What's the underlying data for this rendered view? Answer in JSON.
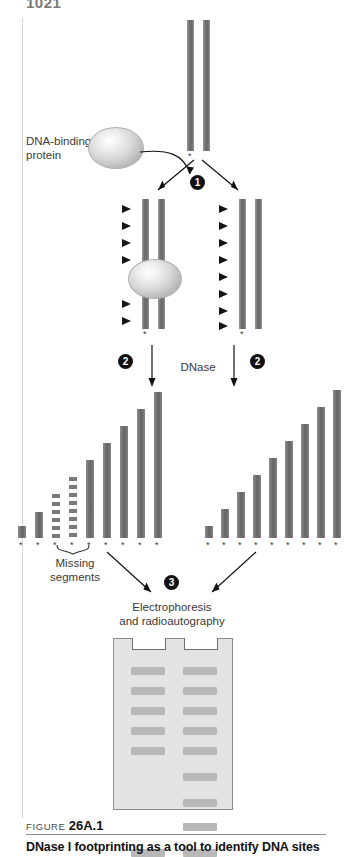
{
  "page": {
    "number": "1021"
  },
  "figure": {
    "labels": {
      "dna_binding_protein": "DNA-binding\nprotein",
      "dnase": "DNase",
      "missing_segments": "Missing\nsegments",
      "electrophoresis": "Electrophoresis\nand radioautography"
    },
    "steps": [
      {
        "id": "step-1",
        "number": "1"
      },
      {
        "id": "step-2-left",
        "number": "2"
      },
      {
        "id": "step-2-right",
        "number": "2"
      },
      {
        "id": "step-3",
        "number": "3"
      }
    ],
    "top_dna": {
      "name": "labeled-dna-duplex",
      "label_marker": "*",
      "strand_count": 2
    },
    "protein_bound_dna": {
      "name": "protein-bound-dna",
      "cut_sites_above": 4,
      "cut_sites_below": 2,
      "protected_region": true,
      "label_marker": "*"
    },
    "free_dna": {
      "name": "free-dna",
      "cut_sites": 8,
      "label_marker": "*"
    },
    "ladder_left": {
      "name": "fragment-ladder-protected",
      "marker": "*",
      "bars": [
        {
          "height": 12,
          "style": "solid"
        },
        {
          "height": 26,
          "style": "solid"
        },
        {
          "height": 44,
          "style": "dashed"
        },
        {
          "height": 61,
          "style": "dashed"
        },
        {
          "height": 78,
          "style": "solid"
        },
        {
          "height": 95,
          "style": "solid"
        },
        {
          "height": 112,
          "style": "solid"
        },
        {
          "height": 129,
          "style": "solid"
        },
        {
          "height": 146,
          "style": "solid"
        }
      ]
    },
    "ladder_right": {
      "name": "fragment-ladder-free",
      "marker": "*",
      "bars": [
        {
          "height": 12,
          "style": "solid"
        },
        {
          "height": 29,
          "style": "solid"
        },
        {
          "height": 46,
          "style": "solid"
        },
        {
          "height": 63,
          "style": "solid"
        },
        {
          "height": 80,
          "style": "solid"
        },
        {
          "height": 97,
          "style": "solid"
        },
        {
          "height": 114,
          "style": "solid"
        },
        {
          "height": 131,
          "style": "solid"
        },
        {
          "height": 148,
          "style": "solid"
        }
      ]
    },
    "gel": {
      "name": "autoradiogram-gel",
      "lane_count": 2,
      "lane_left_bands": [
        14,
        34,
        54,
        74,
        94,
        196
      ],
      "lane_right_bands": [
        14,
        34,
        54,
        74,
        94,
        120,
        146,
        170,
        196
      ]
    }
  },
  "caption": {
    "kicker_prefix": "FIGURE ",
    "kicker_number": "26A.1",
    "title": "DNase I footprinting as a tool to identify DNA sites"
  },
  "colors": {
    "dna": "#6f6f6f",
    "bar": "#6a6a6a",
    "gel_bg": "#e3e3e3",
    "band": "#b8b8b8",
    "ink": "#111111"
  }
}
